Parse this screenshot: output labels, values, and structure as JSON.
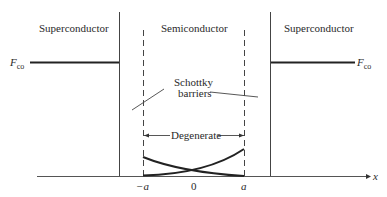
{
  "diagram": {
    "regions": {
      "left": "Superconductor",
      "middle": "Semiconductor",
      "right": "Superconductor"
    },
    "fermi_level": {
      "left_label_main": "F",
      "left_label_sub": "co",
      "right_label_main": "F",
      "right_label_sub": "co"
    },
    "annotations": {
      "schottky_line1": "Schottky",
      "schottky_line2": "barriers",
      "degenerate": "Degenerate"
    },
    "axis": {
      "label": "x",
      "ticks": [
        "−a",
        "0",
        "a"
      ]
    },
    "colors": {
      "ink": "#2a2a2a",
      "background": "#ffffff"
    }
  }
}
